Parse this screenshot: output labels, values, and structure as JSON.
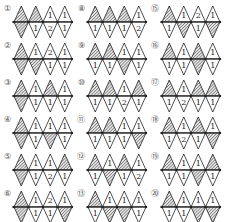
{
  "legend": {
    "H": "hatched (shaded) triangle",
    "number": "count written in triangle"
  },
  "colors": {
    "line": "#222222",
    "hatch": "#444444",
    "background": "#ffffff",
    "label": "#555555"
  },
  "figures": [
    {
      "label": "①",
      "col": 0,
      "row": 0,
      "diamonds": [
        [
          "H",
          "H"
        ],
        [
          "H",
          "1"
        ],
        [
          "1",
          "2"
        ],
        [
          "1",
          "1"
        ]
      ]
    },
    {
      "label": "②",
      "col": 0,
      "row": 1,
      "diamonds": [
        [
          "H",
          "H"
        ],
        [
          "1",
          "H"
        ],
        [
          "2",
          "1"
        ],
        [
          "1",
          "1"
        ]
      ]
    },
    {
      "label": "③",
      "col": 0,
      "row": 2,
      "diamonds": [
        [
          "H",
          "H"
        ],
        [
          "1",
          "1"
        ],
        [
          "H",
          "1"
        ],
        [
          "1",
          "1"
        ]
      ]
    },
    {
      "label": "④",
      "col": 0,
      "row": 3,
      "diamonds": [
        [
          "H",
          "H"
        ],
        [
          "1",
          "1"
        ],
        [
          "1",
          "H"
        ],
        [
          "1",
          "1"
        ]
      ]
    },
    {
      "label": "⑤",
      "col": 0,
      "row": 4,
      "diamonds": [
        [
          "H",
          "H"
        ],
        [
          "1",
          "1"
        ],
        [
          "1",
          "2"
        ],
        [
          "H",
          "1"
        ]
      ]
    },
    {
      "label": "⑥",
      "col": 0,
      "row": 5,
      "diamonds": [
        [
          "H",
          "H"
        ],
        [
          "1",
          "1"
        ],
        [
          "2",
          "1"
        ],
        [
          "1",
          "H"
        ]
      ]
    },
    {
      "label": "⑧",
      "col": 1,
      "row": 0,
      "diamonds": [
        [
          "H",
          "1"
        ],
        [
          "H",
          "1"
        ],
        [
          "H",
          "1"
        ],
        [
          "1",
          "2"
        ]
      ]
    },
    {
      "label": "⑨",
      "col": 1,
      "row": 1,
      "diamonds": [
        [
          "H",
          "1"
        ],
        [
          "H",
          "1"
        ],
        [
          "1",
          "H"
        ],
        [
          "1",
          "1"
        ]
      ]
    },
    {
      "label": "⑩",
      "col": 1,
      "row": 2,
      "diamonds": [
        [
          "H",
          "1"
        ],
        [
          "H",
          "1"
        ],
        [
          "1",
          "2"
        ],
        [
          "H",
          "1"
        ]
      ]
    },
    {
      "label": "⑪",
      "col": 1,
      "row": 3,
      "diamonds": [
        [
          "H",
          "1"
        ],
        [
          "H",
          "1"
        ],
        [
          "1",
          "1"
        ],
        [
          "1",
          "H"
        ]
      ]
    },
    {
      "label": "⑫",
      "col": 1,
      "row": 4,
      "diamonds": [
        [
          "H",
          "1"
        ],
        [
          "1",
          "H"
        ],
        [
          "H",
          "1"
        ],
        [
          "1",
          "2"
        ]
      ]
    },
    {
      "label": "⑬",
      "col": 1,
      "row": 5,
      "diamonds": [
        [
          "H",
          "1"
        ],
        [
          "1",
          "H"
        ],
        [
          "1",
          "H"
        ],
        [
          "1",
          "1"
        ]
      ]
    },
    {
      "label": "⑮",
      "col": 2,
      "row": 0,
      "diamonds": [
        [
          "H",
          "1"
        ],
        [
          "1",
          "H"
        ],
        [
          "2",
          "1"
        ],
        [
          "1",
          "H"
        ]
      ]
    },
    {
      "label": "⑯",
      "col": 2,
      "row": 1,
      "diamonds": [
        [
          "H",
          "1"
        ],
        [
          "1",
          "1"
        ],
        [
          "H",
          "H"
        ],
        [
          "1",
          "1"
        ]
      ]
    },
    {
      "label": "⑰",
      "col": 2,
      "row": 2,
      "diamonds": [
        [
          "H",
          "1"
        ],
        [
          "1",
          "2"
        ],
        [
          "H",
          "1"
        ],
        [
          "H",
          "1"
        ]
      ]
    },
    {
      "label": "⑱",
      "col": 2,
      "row": 3,
      "diamonds": [
        [
          "H",
          "1"
        ],
        [
          "1",
          "2"
        ],
        [
          "H",
          "1"
        ],
        [
          "1",
          "H"
        ]
      ]
    },
    {
      "label": "⑲",
      "col": 2,
      "row": 4,
      "diamonds": [
        [
          "H",
          "1"
        ],
        [
          "1",
          "1"
        ],
        [
          "1",
          "H"
        ],
        [
          "H",
          "1"
        ]
      ]
    },
    {
      "label": "⑳",
      "col": 2,
      "row": 5,
      "diamonds": [
        [
          "H",
          "1"
        ],
        [
          "1",
          "1"
        ],
        [
          "1",
          "H"
        ],
        [
          "1",
          "H"
        ]
      ]
    }
  ]
}
